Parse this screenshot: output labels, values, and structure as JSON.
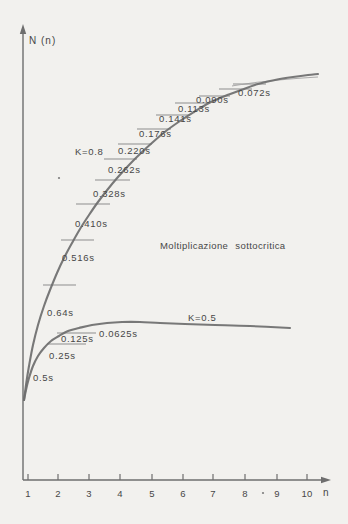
{
  "page": {
    "background": "#f2f1ee",
    "ink_color": "#6e6e6e",
    "text_color": "#474747"
  },
  "chart_data": {
    "type": "line",
    "title": "Moltiplicazione sottocritica",
    "ylabel": "N (n)",
    "xlabel": "n",
    "x_ticks": [
      "1",
      "2",
      "3",
      "4",
      "5",
      "6",
      "7",
      "8",
      "9",
      "10"
    ],
    "x_range": [
      1,
      10
    ],
    "grid": false,
    "legend_position": "inline-on-curves",
    "series": [
      {
        "name": "K=0.8",
        "K": 0.8,
        "saturates_toward": "N = 1/(1-K) = 5",
        "time_labels": [
          "0.64s",
          "0.516s",
          "0.410s",
          "0.328s",
          "0.262s",
          "0.220s",
          "0.176s",
          "0.141s",
          "0.113s",
          "0.090s",
          "0.072s"
        ]
      },
      {
        "name": "K=0.5",
        "K": 0.5,
        "saturates_toward": "N = 1/(1-K) = 2",
        "time_labels": [
          "0.5s",
          "0.25s",
          "0.125s",
          "0.0625s"
        ]
      }
    ]
  },
  "render": {
    "axis": {
      "origin": [
        23,
        480
      ],
      "y_top": 28,
      "y_arrow_tip": 24,
      "x_right": 323,
      "x_arrow_tip": 331,
      "tick_top": 474
    },
    "x_tick_px": [
      28,
      58,
      89,
      120,
      152,
      183,
      213,
      245,
      277,
      307
    ],
    "tick_label_baseline": 497,
    "series": [
      {
        "ref": 0,
        "name_pos": [
          75,
          147
        ],
        "points": [
          [
            24,
            400
          ],
          [
            26,
            385
          ],
          [
            29,
            366
          ],
          [
            33,
            345
          ],
          [
            38,
            325
          ],
          [
            44,
            306
          ],
          [
            50,
            290
          ],
          [
            57,
            273
          ],
          [
            64,
            258
          ],
          [
            72,
            243
          ],
          [
            80,
            229
          ],
          [
            89,
            215
          ],
          [
            98,
            202
          ],
          [
            108,
            189
          ],
          [
            118,
            177
          ],
          [
            129,
            165
          ],
          [
            141,
            153
          ],
          [
            153,
            142
          ],
          [
            166,
            131
          ],
          [
            180,
            121
          ],
          [
            194,
            112
          ],
          [
            209,
            103
          ],
          [
            225,
            96
          ],
          [
            241,
            90
          ],
          [
            258,
            84
          ],
          [
            275,
            80
          ],
          [
            293,
            77
          ],
          [
            308,
            75
          ],
          [
            318,
            74
          ]
        ],
        "retrace": [
          [
            232,
            86
          ],
          [
            260,
            82
          ],
          [
            290,
            79
          ],
          [
            318,
            77
          ]
        ],
        "dashes": [
          [
            43,
            76,
            285
          ],
          [
            61,
            94,
            240
          ],
          [
            76,
            110,
            204
          ],
          [
            95,
            130,
            180
          ],
          [
            104,
            137,
            159
          ],
          [
            118,
            152,
            144
          ],
          [
            137,
            171,
            129
          ],
          [
            156,
            190,
            115
          ],
          [
            175,
            209,
            103
          ],
          [
            199,
            230,
            96
          ],
          [
            219,
            252,
            89
          ],
          [
            233,
            266,
            84
          ]
        ],
        "label_pos": [
          [
            47,
            308
          ],
          [
            62,
            253
          ],
          [
            75,
            219
          ],
          [
            93,
            189
          ],
          [
            108,
            165
          ],
          [
            118,
            146
          ],
          [
            139,
            129
          ],
          [
            159,
            114
          ],
          [
            178,
            104
          ],
          [
            196,
            95
          ],
          [
            238,
            88
          ]
        ]
      },
      {
        "ref": 1,
        "name_pos": [
          188,
          313
        ],
        "points": [
          [
            24,
            400
          ],
          [
            26,
            390
          ],
          [
            29,
            378
          ],
          [
            33,
            366
          ],
          [
            38,
            356
          ],
          [
            44,
            348
          ],
          [
            51,
            341
          ],
          [
            59,
            336
          ],
          [
            68,
            331
          ],
          [
            79,
            328
          ],
          [
            92,
            325
          ],
          [
            107,
            323
          ],
          [
            122,
            322
          ],
          [
            140,
            322
          ],
          [
            160,
            323
          ],
          [
            185,
            324
          ],
          [
            215,
            325
          ],
          [
            250,
            326
          ],
          [
            290,
            328
          ]
        ],
        "retrace": [],
        "dashes": [
          [
            57,
            96,
            333
          ],
          [
            47,
            86,
            344
          ]
        ],
        "label_pos": [
          [
            33,
            373
          ],
          [
            49,
            351
          ],
          [
            61,
            334
          ],
          [
            99,
            329
          ]
        ]
      }
    ],
    "specks": [
      [
        263,
        493
      ],
      [
        59,
        178
      ]
    ]
  }
}
